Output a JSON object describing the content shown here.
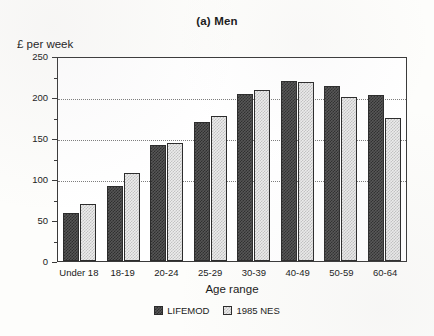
{
  "chart_data": {
    "type": "bar",
    "title": "(a) Men",
    "xlabel": "Age range",
    "ylabel": "£ per week",
    "categories": [
      "Under 18",
      "18-19",
      "20-24",
      "25-29",
      "30-39",
      "40-49",
      "50-59",
      "60-64"
    ],
    "series": [
      {
        "name": "LIFEMOD",
        "values": [
          58,
          91,
          142,
          170,
          204,
          220,
          214,
          203
        ]
      },
      {
        "name": "1985 NES",
        "values": [
          70,
          107,
          144,
          177,
          208,
          218,
          200,
          174
        ]
      }
    ],
    "ylim": [
      0,
      250
    ],
    "yticks": [
      0,
      50,
      100,
      150,
      200,
      250
    ],
    "ytick_labels": [
      "0",
      "50",
      "100",
      "150",
      "200",
      "250"
    ],
    "minor_ytick_interval": 25,
    "gridlines": [
      "100",
      "150",
      "200"
    ],
    "grid": true,
    "legend_position": "bottom-center",
    "colors": {
      "series_0_fill": "#565656",
      "series_1_fill": "#ececec",
      "bar_border": "#2c2c2c",
      "frame": "#3a3a3a",
      "gridline": "#7d7d7d",
      "background": "#fdfdfb"
    }
  }
}
